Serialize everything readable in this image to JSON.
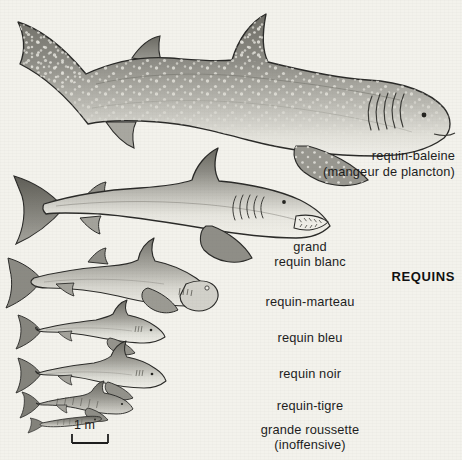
{
  "plate": {
    "title": "REQUINS",
    "background_color": "#f3f2ec",
    "ink_color": "#1d1d1d",
    "scale": {
      "label": "1 m",
      "meaning": "one metre reference bar"
    }
  },
  "labels": {
    "whale_shark": "requin-baleine",
    "whale_shark_note": "(mangeur de plancton)",
    "great_white_line1": "grand",
    "great_white_line2": "requin blanc",
    "hammerhead": "requin-marteau",
    "blue_shark": "requin bleu",
    "black_shark": "requin noir",
    "tiger_shark": "requin-tigre",
    "catshark": "grande roussette",
    "catshark_note": "(inoffensive)"
  },
  "species": [
    {
      "name": "requin-baleine",
      "note": "(mangeur de plancton)",
      "order": 1,
      "relative_size": "largest"
    },
    {
      "name": "grand requin blanc",
      "note": "",
      "order": 2,
      "relative_size": "very large"
    },
    {
      "name": "requin-marteau",
      "note": "",
      "order": 3,
      "relative_size": "large"
    },
    {
      "name": "requin bleu",
      "note": "",
      "order": 4,
      "relative_size": "medium"
    },
    {
      "name": "requin noir",
      "note": "",
      "order": 5,
      "relative_size": "medium"
    },
    {
      "name": "requin-tigre",
      "note": "",
      "order": 6,
      "relative_size": "small"
    },
    {
      "name": "grande roussette",
      "note": "(inoffensive)",
      "order": 7,
      "relative_size": "smallest"
    }
  ],
  "palette": {
    "paper": "#f3f2ec",
    "body_dark": "#7b7a74",
    "body_mid": "#a3a29b",
    "body_light": "#d9d8d1",
    "belly": "#efeee8",
    "outline": "#2a2a28",
    "spot": "#e8e7e0"
  }
}
